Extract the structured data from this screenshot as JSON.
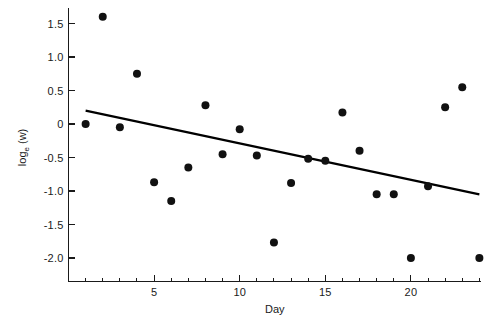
{
  "chart_data": {
    "type": "scatter",
    "title": "",
    "subtitle": "",
    "xlabel": "Day",
    "ylabel": "log_e (w)",
    "ylabel_parts": {
      "base": "log",
      "subscript": "e",
      "arg": " (w)"
    },
    "xlim": [
      0,
      25
    ],
    "ylim": [
      -2.25,
      1.75
    ],
    "x": [
      1,
      2,
      3,
      4,
      5,
      6,
      7,
      8,
      9,
      10,
      11,
      12,
      13,
      14,
      15,
      16,
      17,
      18,
      19,
      20,
      21,
      22,
      23,
      24
    ],
    "y": [
      0.0,
      1.6,
      -0.05,
      0.75,
      -0.87,
      -1.15,
      -0.65,
      0.28,
      -0.45,
      -0.08,
      -0.47,
      -1.77,
      -0.88,
      -0.52,
      -0.55,
      0.17,
      -0.4,
      -1.05,
      -1.05,
      -2.0,
      -0.93,
      0.25,
      0.55,
      -2.0
    ],
    "points": [
      {
        "day": 1,
        "value": 0.0
      },
      {
        "day": 2,
        "value": 1.6
      },
      {
        "day": 3,
        "value": -0.05
      },
      {
        "day": 4,
        "value": 0.75
      },
      {
        "day": 5,
        "value": -0.87
      },
      {
        "day": 6,
        "value": -1.15
      },
      {
        "day": 7,
        "value": -0.65
      },
      {
        "day": 8,
        "value": 0.28
      },
      {
        "day": 9,
        "value": -0.45
      },
      {
        "day": 10,
        "value": -0.08
      },
      {
        "day": 11,
        "value": -0.47
      },
      {
        "day": 12,
        "value": -1.77
      },
      {
        "day": 13,
        "value": -0.88
      },
      {
        "day": 14,
        "value": -0.52
      },
      {
        "day": 15,
        "value": -0.55
      },
      {
        "day": 16,
        "value": 0.17
      },
      {
        "day": 17,
        "value": -0.4
      },
      {
        "day": 18,
        "value": -1.05
      },
      {
        "day": 19,
        "value": -1.05
      },
      {
        "day": 20,
        "value": -2.0
      },
      {
        "day": 21,
        "value": -0.93
      },
      {
        "day": 22,
        "value": 0.25
      },
      {
        "day": 23,
        "value": 0.55
      },
      {
        "day": 24,
        "value": -2.0
      }
    ],
    "trendline": {
      "type": "linear-fit",
      "x_start": 1,
      "y_start": 0.2,
      "x_end": 24,
      "y_end": -1.05,
      "slope": -0.0543,
      "intercept": 0.2543
    },
    "x_ticks_major": [
      5,
      10,
      15,
      20
    ],
    "x_tick_labels": [
      "5",
      "10",
      "15",
      "20"
    ],
    "x_ticks_minor": [
      1,
      2,
      3,
      4,
      6,
      7,
      8,
      9,
      11,
      12,
      13,
      14,
      16,
      17,
      18,
      19,
      21,
      22,
      23,
      24
    ],
    "y_ticks_major": [
      1.5,
      1.0,
      0.5,
      0,
      -0.5,
      -1.0,
      -1.5,
      -2.0
    ],
    "y_tick_labels": [
      "1.5",
      "1.0",
      "0.5",
      "0",
      "-0.5",
      "-1.0",
      "-1.5",
      "-2.0"
    ],
    "grid": false,
    "legend": null,
    "marker": {
      "shape": "circle",
      "color": "#111111",
      "size": 4
    },
    "line_color": "#000000",
    "background": "#ffffff"
  }
}
